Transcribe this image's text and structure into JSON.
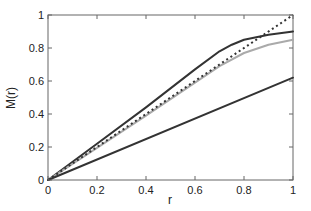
{
  "chart_data": {
    "type": "line",
    "title": "",
    "xlabel": "r",
    "ylabel": "M(r)",
    "xlim": [
      0,
      1
    ],
    "ylim": [
      0,
      1
    ],
    "grid": false,
    "legend": null,
    "x_ticks": [
      "0",
      "0.2",
      "0.4",
      "0.6",
      "0.8",
      "1"
    ],
    "y_ticks": [
      "0",
      "0.2",
      "0.4",
      "0.6",
      "0.8",
      "1"
    ],
    "series": [
      {
        "name": "dark-solid-upper",
        "style": "solid",
        "color": "#333333",
        "x": [
          0,
          0.2,
          0.4,
          0.6,
          0.7,
          0.75,
          0.8,
          0.9,
          1.0
        ],
        "y": [
          0,
          0.22,
          0.44,
          0.67,
          0.78,
          0.82,
          0.85,
          0.88,
          0.9
        ]
      },
      {
        "name": "gray-solid",
        "style": "solid",
        "color": "#aaaaaa",
        "x": [
          0,
          0.2,
          0.4,
          0.6,
          0.7,
          0.8,
          0.9,
          1.0
        ],
        "y": [
          0,
          0.195,
          0.39,
          0.59,
          0.69,
          0.77,
          0.82,
          0.85
        ]
      },
      {
        "name": "dotted-identity",
        "style": "dotted",
        "color": "#333333",
        "x": [
          0,
          1
        ],
        "y": [
          0,
          1
        ]
      },
      {
        "name": "dark-solid-lower",
        "style": "solid",
        "color": "#333333",
        "x": [
          0,
          1
        ],
        "y": [
          0,
          0.62
        ]
      }
    ]
  }
}
